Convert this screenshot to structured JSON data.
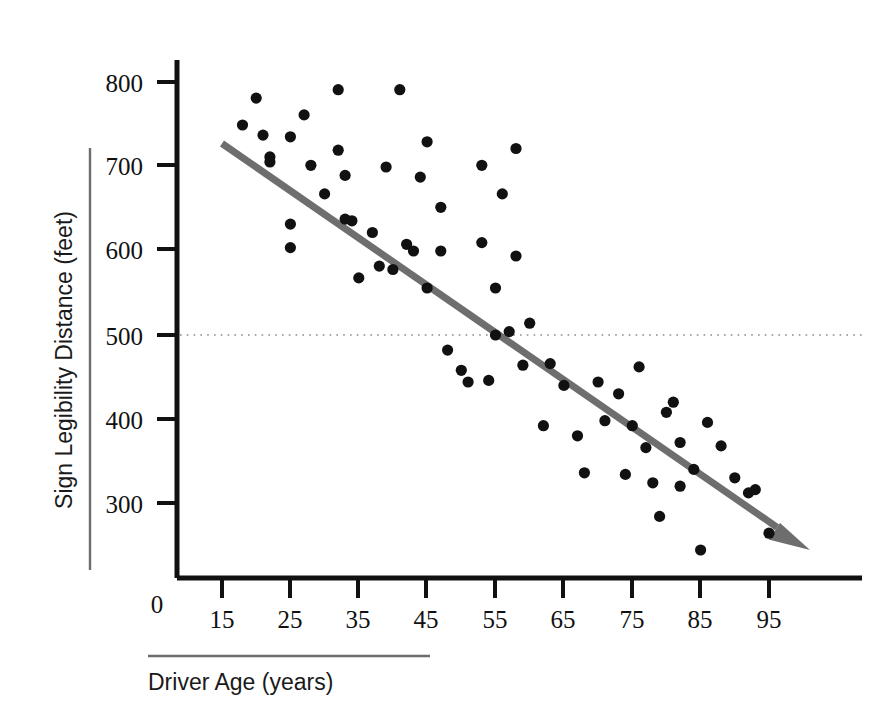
{
  "chart_data": {
    "type": "scatter",
    "title": "",
    "xlabel": "Driver Age (years)",
    "ylabel": "Sign Legibility Distance (feet)",
    "xlim": [
      10,
      102
    ],
    "ylim": [
      200,
      830
    ],
    "xticks": [
      15,
      25,
      35,
      45,
      55,
      65,
      75,
      85,
      95
    ],
    "xtick_labels": [
      "15",
      "25",
      "35",
      "45",
      "55",
      "65",
      "75",
      "85",
      "95"
    ],
    "yticks": [
      300,
      400,
      500,
      600,
      700,
      800
    ],
    "ytick_labels": [
      "300",
      "400",
      "500",
      "600",
      "700",
      "800"
    ],
    "origin_label": "0",
    "grid": false,
    "reference_lines": [
      {
        "name": "500-feet-reference",
        "axis": "y",
        "value": 500,
        "style": "dotted"
      }
    ],
    "legend": null,
    "series": [
      {
        "name": "Driver sign legibility observations",
        "marker": "filled-circle",
        "color": "#111111",
        "points": [
          [
            18,
            750
          ],
          [
            20,
            782
          ],
          [
            21,
            738
          ],
          [
            22,
            712
          ],
          [
            22,
            706
          ],
          [
            25,
            736
          ],
          [
            25,
            632
          ],
          [
            25,
            604
          ],
          [
            27,
            762
          ],
          [
            28,
            702
          ],
          [
            30,
            668
          ],
          [
            32,
            792
          ],
          [
            32,
            720
          ],
          [
            33,
            690
          ],
          [
            33,
            638
          ],
          [
            34,
            636
          ],
          [
            35,
            568
          ],
          [
            37,
            622
          ],
          [
            38,
            582
          ],
          [
            39,
            700
          ],
          [
            40,
            578
          ],
          [
            41,
            792
          ],
          [
            42,
            608
          ],
          [
            43,
            600
          ],
          [
            44,
            688
          ],
          [
            45,
            730
          ],
          [
            45,
            556
          ],
          [
            47,
            652
          ],
          [
            47,
            600
          ],
          [
            48,
            482
          ],
          [
            50,
            458
          ],
          [
            51,
            444
          ],
          [
            53,
            702
          ],
          [
            53,
            610
          ],
          [
            54,
            446
          ],
          [
            55,
            556
          ],
          [
            55,
            500
          ],
          [
            56,
            668
          ],
          [
            57,
            504
          ],
          [
            58,
            722
          ],
          [
            58,
            594
          ],
          [
            59,
            464
          ],
          [
            60,
            514
          ],
          [
            62,
            392
          ],
          [
            63,
            466
          ],
          [
            65,
            440
          ],
          [
            67,
            380
          ],
          [
            68,
            336
          ],
          [
            70,
            444
          ],
          [
            71,
            398
          ],
          [
            73,
            430
          ],
          [
            74,
            334
          ],
          [
            75,
            392
          ],
          [
            76,
            462
          ],
          [
            77,
            366
          ],
          [
            78,
            324
          ],
          [
            79,
            284
          ],
          [
            80,
            408
          ],
          [
            81,
            420
          ],
          [
            82,
            372
          ],
          [
            82,
            320
          ],
          [
            84,
            340
          ],
          [
            85,
            244
          ],
          [
            86,
            396
          ],
          [
            88,
            368
          ],
          [
            90,
            330
          ],
          [
            92,
            312
          ],
          [
            93,
            316
          ],
          [
            95,
            264
          ]
        ]
      }
    ],
    "trendline": {
      "name": "downward-trend-arrow",
      "color": "#6e6e6e",
      "start": [
        15,
        728
      ],
      "end": [
        101,
        244
      ],
      "arrow": true
    }
  },
  "axes": {
    "y_axis_name": "sign-legibility-distance-axis",
    "x_axis_name": "driver-age-axis"
  }
}
